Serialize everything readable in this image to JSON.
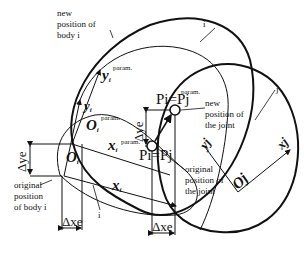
{
  "diagram": {
    "labels": {
      "new_body_i": [
        "new",
        "position of",
        "body i"
      ],
      "body_i_top": "i",
      "body_j": "j",
      "body_i_bottom": "i",
      "original_body_i": [
        "original",
        "position",
        "of body i"
      ],
      "new_joint": [
        "new",
        "position of",
        "the joint"
      ],
      "original_joint": [
        "original",
        "position of",
        "the joint"
      ],
      "y_i_param": "y",
      "y_i_param_sub": "i",
      "y_i_param_sup": "param.",
      "y_i": "y",
      "y_i_sub": "i",
      "O_i_param": "O",
      "O_i_param_sub": "i",
      "O_i_param_sup": "param.",
      "O_i": "O",
      "O_i_sub": "i",
      "x_i_param": "x",
      "x_i_param_sub": "i",
      "x_i_param_sup": "param.",
      "x_i": "x",
      "x_i_sub": "i",
      "Pi_eq_Pj_new": "Pi=Pj",
      "Pi_eq_Pj_new_sup": "param.",
      "Pi_eq_Pj_orig": "Pi=Pj",
      "delta_y_e_left": "Δye",
      "delta_y_e_mid": "Δye",
      "delta_x_e_left": "Δxe",
      "delta_x_e_right": "Δxe",
      "y_j": "yj",
      "x_j": "xj",
      "O_j": "Oj"
    },
    "colors": {
      "stroke": "#111111",
      "background": "#ffffff"
    }
  }
}
